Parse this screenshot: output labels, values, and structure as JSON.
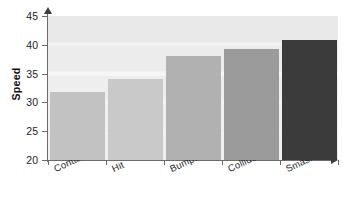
{
  "chart_data": {
    "type": "bar",
    "title": "",
    "xlabel": "",
    "ylabel": "Speed",
    "categories": [
      "Contacted",
      "Hit",
      "Bumped",
      "Collided",
      "Smashed"
    ],
    "values": [
      31.8,
      34.0,
      38.0,
      39.3,
      40.8
    ],
    "ylim": [
      20,
      45
    ],
    "yticks": [
      20,
      25,
      30,
      35,
      40,
      45
    ],
    "ytick_labels": [
      "20",
      "25",
      "30",
      "35",
      "40",
      "45"
    ],
    "grid": true,
    "legend": "none",
    "bar_colors": [
      "#c2c2c2",
      "#c9c9c9",
      "#b1b1b1",
      "#9b9b9b",
      "#3b3b3b"
    ],
    "axis_color": "#6b6b6b",
    "plot_background": "#efefef",
    "page_background": "#ffffff",
    "text_color": "#1d1d1d"
  }
}
